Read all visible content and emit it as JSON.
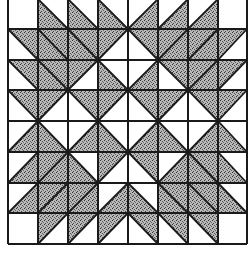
{
  "colors": {
    "ink": "#1a1a1a",
    "shade": "#9a9a9a",
    "background": "#ffffff"
  },
  "grid": {
    "rows": 8,
    "cols": 8,
    "x_lines": [
      8,
      38,
      68,
      98,
      128,
      158,
      188,
      218,
      247
    ],
    "y_lines": [
      -1,
      29,
      60,
      90,
      121,
      152,
      183,
      213,
      244
    ]
  },
  "cells": [
    [
      "none:",
      "BL:\\",
      "BL:\\",
      "BL:\\",
      "BR:/",
      "BR:/",
      "BR:/",
      "none:"
    ],
    [
      "TR:\\",
      "full:\\",
      "full:\\",
      "TL:/",
      "TR:\\",
      "full:/",
      "full:/",
      "TL:/"
    ],
    [
      "TR:\\",
      "full:\\",
      "TL:/",
      "BL:\\",
      "BR:/",
      "TR:\\",
      "full:/",
      "TL:/"
    ],
    [
      "TR:\\",
      "TL:/",
      "TR:\\",
      "TL:/",
      "TR:\\",
      "TL:/",
      "TR:\\",
      "TL:/"
    ],
    [
      "BR:/",
      "BL:\\",
      "BR:/",
      "BL:\\",
      "BR:/",
      "BL:\\",
      "BR:/",
      "BL:\\"
    ],
    [
      "BR:/",
      "full:/",
      "BL:\\",
      "TL:/",
      "TR:\\",
      "BR:/",
      "full:\\",
      "BL:\\"
    ],
    [
      "BR:/",
      "full:/",
      "full:/",
      "BR:/",
      "BL:\\",
      "full:\\",
      "full:\\",
      "BL:\\"
    ],
    [
      "none:",
      "TL:/",
      "TL:/",
      "TL:/",
      "TR:\\",
      "TR:\\",
      "TR:\\",
      "none:"
    ]
  ]
}
